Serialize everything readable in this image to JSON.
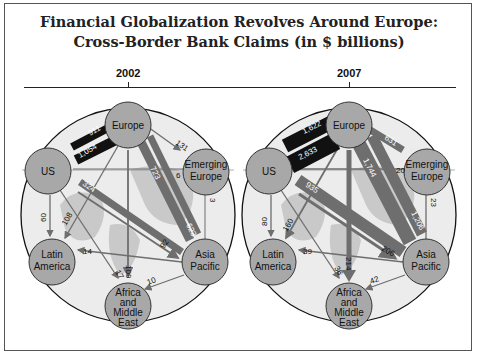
{
  "title": {
    "line1": "Financial Globalization Revolves Around Europe:",
    "line2": "Cross-Border Bank Claims (in $ billions)"
  },
  "panels": [
    {
      "year": "2002",
      "nodes": {
        "us": "US",
        "europe": "Europe",
        "emerging_europe": [
          "Emerging",
          "Europe"
        ],
        "latin_america": [
          "Latin",
          "America"
        ],
        "asia_pacific": [
          "Asia",
          "Pacific"
        ],
        "africa_me": [
          "Africa",
          "and",
          "Middle",
          "East"
        ]
      },
      "flows": {
        "us_to_europe": "911",
        "europe_to_us": "1,054",
        "europe_to_emerging": "131",
        "emerging_to_us": "6",
        "emerging_to_asia": "3",
        "asia_to_europe": "723",
        "europe_to_asia": "623",
        "asia_to_us": "324",
        "us_to_asia": "92",
        "us_to_latin": "60",
        "europe_to_latin": "108",
        "asia_to_latin": "14",
        "us_to_africa": "17",
        "europe_to_africa": "109",
        "asia_to_africa": "10"
      }
    },
    {
      "year": "2007",
      "nodes": {
        "us": "US",
        "europe": "Europe",
        "emerging_europe": [
          "Emerging",
          "Europe"
        ],
        "latin_america": [
          "Latin",
          "America"
        ],
        "asia_pacific": [
          "Asia",
          "Pacific"
        ],
        "africa_me": [
          "Africa",
          "and",
          "Middle",
          "East"
        ]
      },
      "flows": {
        "us_to_europe": "1,622",
        "europe_to_us": "2,633",
        "europe_to_emerging": "631",
        "emerging_to_us": "20",
        "emerging_to_asia": "23",
        "asia_to_europe": "1,744",
        "europe_to_asia": "1,206",
        "asia_to_us": "935",
        "us_to_asia": "206",
        "us_to_latin": "80",
        "europe_to_latin": "160",
        "asia_to_latin": "39",
        "us_to_africa": "36",
        "europe_to_africa": "214",
        "asia_to_africa": "42"
      }
    }
  ],
  "colors": {
    "node_fill": "#a8a8a8",
    "globe_fill": "#ececec",
    "land_fill": "#c9c9c9",
    "arrow_dark": "#111111",
    "arrow_mid": "#6e6e6e",
    "arrow_thin": "#7a7a7a"
  }
}
